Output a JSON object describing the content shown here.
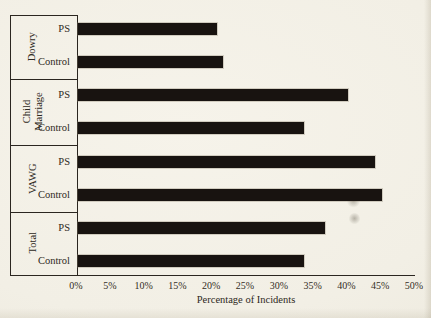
{
  "figure": {
    "colors": {
      "background": "#f2efe5",
      "bar": "#181310",
      "line": "#2b2620",
      "text": "#2d2821"
    }
  },
  "chart_data": {
    "type": "bar",
    "orientation": "horizontal",
    "title": "",
    "xlabel": "Percentage of Incidents",
    "ylabel": "",
    "xlim": [
      0,
      50
    ],
    "x_tick_step": 5,
    "x_ticks": [
      "0%",
      "5%",
      "10%",
      "15%",
      "20%",
      "25%",
      "30%",
      "35%",
      "40%",
      "45%",
      "50%"
    ],
    "value_unit": "%",
    "grid": false,
    "legend": false,
    "groups": [
      {
        "label": "Dowry",
        "bars": [
          {
            "label": "PS",
            "value": 20.5
          },
          {
            "label": "Control",
            "value": 21.5
          }
        ]
      },
      {
        "label": "Child Marriage",
        "bars": [
          {
            "label": "PS",
            "value": 40
          },
          {
            "label": "Control",
            "value": 33.5
          }
        ]
      },
      {
        "label": "VAWG",
        "bars": [
          {
            "label": "PS",
            "value": 44
          },
          {
            "label": "Control",
            "value": 45
          }
        ]
      },
      {
        "label": "Total",
        "bars": [
          {
            "label": "PS",
            "value": 36.5
          },
          {
            "label": "Control",
            "value": 33.5
          }
        ]
      }
    ]
  }
}
